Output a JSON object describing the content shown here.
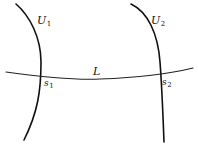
{
  "diagram": {
    "curves": [
      {
        "id": "U1",
        "label": "U",
        "subscript": "1",
        "intersection_label": "s",
        "intersection_subscript": "1"
      },
      {
        "id": "U2",
        "label": "U",
        "subscript": "2",
        "intersection_label": "s",
        "intersection_subscript": "2"
      }
    ],
    "line": {
      "id": "L",
      "label": "L"
    },
    "colors": {
      "stroke": "#111111",
      "background": "#ffffff"
    }
  }
}
